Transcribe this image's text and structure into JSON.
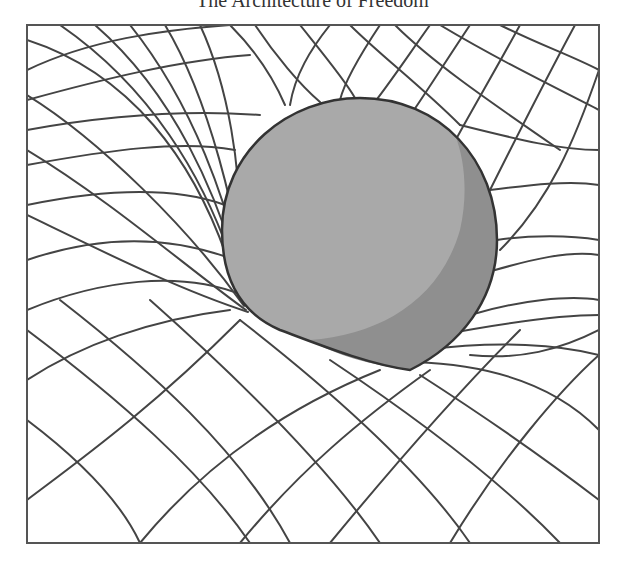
{
  "title": "The Architecture of Freedom",
  "figure": {
    "frame": {
      "x": 27,
      "y": 25,
      "width": 572,
      "height": 518,
      "stroke": "#555555"
    },
    "grid_color": "#444444",
    "sphere": {
      "fill": "#a9a9a9",
      "shadow_fill": "#8f8f8f",
      "outline": "#333333"
    }
  }
}
